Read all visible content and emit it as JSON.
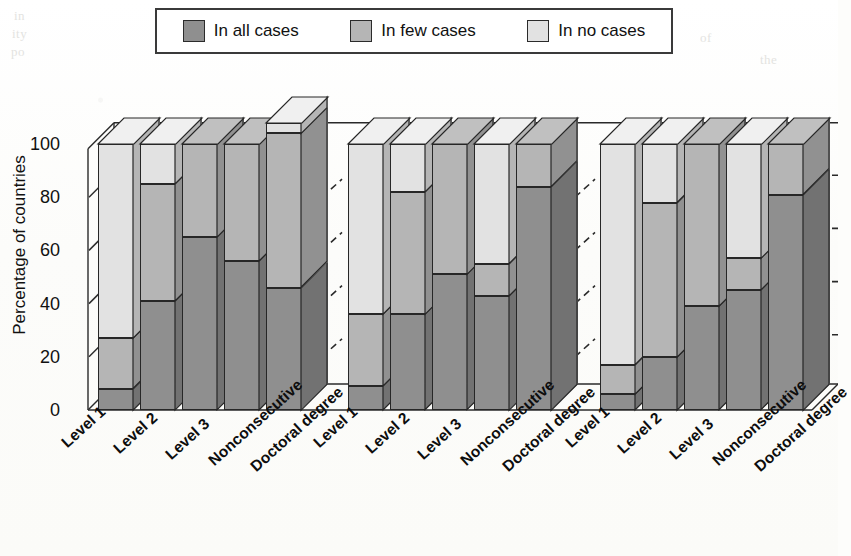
{
  "legend": {
    "entries": [
      {
        "label": "In all cases",
        "color": "#8f8f8f",
        "name": "in-all-cases"
      },
      {
        "label": "In few cases",
        "color": "#b5b5b5",
        "name": "in-few-cases"
      },
      {
        "label": "In no cases",
        "color": "#e2e2e2",
        "name": "in-no-cases"
      }
    ]
  },
  "axes": {
    "ylabel": "Percentage of countries",
    "yticks": [
      "100",
      "80",
      "60",
      "40",
      "20",
      "0"
    ],
    "ymin": 0,
    "ymax": 100
  },
  "bleed_text": [
    {
      "text": "in",
      "x": 14,
      "y": 8
    },
    {
      "text": "ity",
      "x": 12,
      "y": 26
    },
    {
      "text": "po",
      "x": 11,
      "y": 44
    },
    {
      "text": "of",
      "x": 700,
      "y": 30
    },
    {
      "text": "the",
      "x": 760,
      "y": 52
    },
    {
      "text": "nat",
      "x": 795,
      "y": 300
    }
  ],
  "chart_data": {
    "type": "bar",
    "title": "",
    "subtype": "stacked-3d-percent",
    "xlabel": "",
    "ylabel": "Percentage of countries",
    "ylim": [
      0,
      100
    ],
    "grid": false,
    "legend_position": "top",
    "legend_entries": [
      "In all cases",
      "In few cases",
      "In no cases"
    ],
    "categories": [
      "Level 1",
      "Level 2",
      "Level 3",
      "Nonconsecutive",
      "Doctoral degree"
    ],
    "groups": [
      {
        "name": "Group 1",
        "series": [
          {
            "name": "In all cases",
            "values": [
              8,
              41,
              65,
              56,
              46
            ]
          },
          {
            "name": "In few cases",
            "values": [
              19,
              44,
              35,
              44,
              58
            ]
          },
          {
            "name": "In no cases",
            "values": [
              73,
              15,
              0,
              0,
              0
            ]
          }
        ],
        "cumulative": {
          "In all cases": [
            8,
            41,
            65,
            56,
            46
          ],
          "In few cases": [
            27,
            85,
            100,
            100,
            104
          ],
          "In no cases": [
            100,
            100,
            100,
            100,
            108
          ]
        }
      },
      {
        "name": "Group 2",
        "series": [
          {
            "name": "In all cases",
            "values": [
              9,
              36,
              51,
              43,
              84
            ]
          },
          {
            "name": "In few cases",
            "values": [
              27,
              46,
              49,
              12,
              16
            ]
          },
          {
            "name": "In no cases",
            "values": [
              64,
              18,
              0,
              45,
              0
            ]
          }
        ],
        "cumulative": {
          "In all cases": [
            9,
            36,
            51,
            43,
            84
          ],
          "In few cases": [
            36,
            82,
            100,
            55,
            100
          ],
          "In no cases": [
            100,
            100,
            100,
            100,
            100
          ]
        }
      },
      {
        "name": "Group 3",
        "series": [
          {
            "name": "In all cases",
            "values": [
              6,
              20,
              39,
              45,
              81
            ]
          },
          {
            "name": "In few cases",
            "values": [
              11,
              58,
              61,
              12,
              19
            ]
          },
          {
            "name": "In no cases",
            "values": [
              83,
              22,
              0,
              43,
              0
            ]
          }
        ],
        "cumulative": {
          "In all cases": [
            6,
            20,
            39,
            45,
            81
          ],
          "In few cases": [
            17,
            78,
            100,
            57,
            100
          ],
          "In no cases": [
            100,
            100,
            100,
            100,
            100
          ]
        }
      }
    ]
  }
}
